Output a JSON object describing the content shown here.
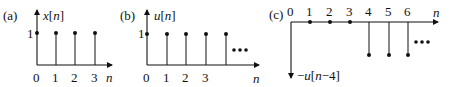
{
  "panels": [
    {
      "id": "a",
      "label": "(a)",
      "signal_var": "x",
      "signal_arg": "n",
      "signal_label": "x[n]",
      "x_axis_label": "n",
      "y_tick_label": "1",
      "x_ticks": [
        "0",
        "1",
        "2",
        "3"
      ],
      "samples": [
        {
          "n": 0,
          "value": 1
        },
        {
          "n": 1,
          "value": 1
        },
        {
          "n": 2,
          "value": 1
        },
        {
          "n": 3,
          "value": 1
        }
      ],
      "continues": false
    },
    {
      "id": "b",
      "label": "(b)",
      "signal_var": "u",
      "signal_arg": "n",
      "signal_label": "u[n]",
      "x_axis_label": "n",
      "y_tick_label": "1",
      "x_ticks": [
        "0",
        "1",
        "2",
        "3"
      ],
      "samples": [
        {
          "n": 0,
          "value": 1
        },
        {
          "n": 1,
          "value": 1
        },
        {
          "n": 2,
          "value": 1
        },
        {
          "n": 3,
          "value": 1
        },
        {
          "n": 4,
          "value": 1
        }
      ],
      "continues": true,
      "ellipsis": "•••"
    },
    {
      "id": "c",
      "label": "(c)",
      "signal_label": "−u[n−4]",
      "signal_prefix": "−",
      "signal_var": "u",
      "signal_arg": "n−4",
      "x_axis_label": "n",
      "x_ticks": [
        "0",
        "1",
        "2",
        "3",
        "4",
        "5",
        "6"
      ],
      "samples": [
        {
          "n": 0,
          "value": 0
        },
        {
          "n": 1,
          "value": 0
        },
        {
          "n": 2,
          "value": 0
        },
        {
          "n": 3,
          "value": 0
        },
        {
          "n": 4,
          "value": -1
        },
        {
          "n": 5,
          "value": -1
        },
        {
          "n": 6,
          "value": -1
        }
      ],
      "continues": true,
      "ellipsis": "•••"
    }
  ],
  "colors": {
    "ink": "#111111",
    "background": "#ffffff"
  }
}
